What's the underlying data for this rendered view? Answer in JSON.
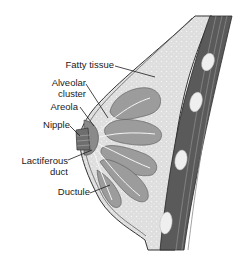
{
  "diagram": {
    "labels": {
      "fatty_tissue": "Fatty tissue",
      "alveolar_line1": "Alveolar",
      "alveolar_line2": "cluster",
      "areola": "Areola",
      "nipple": "Nipple",
      "lactiferous_line1": "Lactiferous",
      "lactiferous_line2": "duct",
      "ductule": "Ductule"
    },
    "colors": {
      "fat": "#dcdcdc",
      "muscle_dark": "#4a4a4a",
      "muscle_mid": "#7a7a7a",
      "lobule": "#9a9a9a",
      "outline": "#333333",
      "nipple": "#7c7c7c"
    }
  }
}
